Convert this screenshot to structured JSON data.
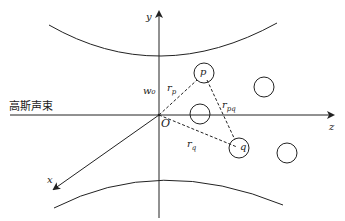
{
  "diagram": {
    "title_label": "高斯声束",
    "axes": {
      "y_label": "y",
      "z_label": "z",
      "x_label": "x",
      "origin_label": "O"
    },
    "labels": {
      "w0": "w₀",
      "rp": "r",
      "rp_sub": "p",
      "rq": "r",
      "rq_sub": "q",
      "rpq": "r",
      "rpq_sub": "pq",
      "p": "p",
      "q": "q"
    },
    "colors": {
      "line": "#222222",
      "background": "#ffffff"
    },
    "particles": [
      {
        "name": "particle-p",
        "cx": 204,
        "cy": 73,
        "r": 10,
        "label": "p"
      },
      {
        "name": "particle-mid",
        "cx": 200,
        "cy": 114,
        "r": 10
      },
      {
        "name": "particle-right-upper",
        "cx": 264,
        "cy": 87,
        "r": 10
      },
      {
        "name": "particle-q",
        "cx": 239,
        "cy": 148,
        "r": 10,
        "label": "q"
      },
      {
        "name": "particle-right-lower",
        "cx": 287,
        "cy": 153,
        "r": 10
      }
    ]
  }
}
